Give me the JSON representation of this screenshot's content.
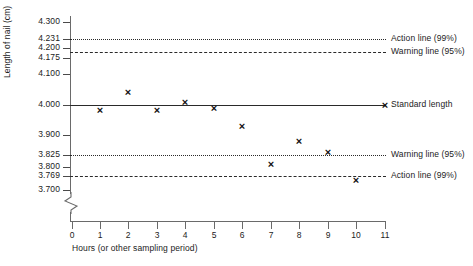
{
  "chart_data": {
    "type": "scatter",
    "title": "",
    "xlabel": "Hours (or other sampling period)",
    "ylabel": "Length of nail (cm)",
    "x": [
      1,
      2,
      3,
      4,
      5,
      6,
      7,
      8,
      9,
      10,
      11
    ],
    "values": [
      3.985,
      4.04,
      3.985,
      4.01,
      3.99,
      3.93,
      3.805,
      3.88,
      3.845,
      3.775,
      3.998
    ],
    "categories": [
      "1",
      "2",
      "3",
      "4",
      "5",
      "6",
      "7",
      "8",
      "9",
      "10",
      "11"
    ],
    "series": [
      {
        "name": "Measured nail length",
        "values": [
          3.985,
          4.04,
          3.985,
          4.01,
          3.99,
          3.93,
          3.805,
          3.88,
          3.845,
          3.775,
          3.998
        ]
      }
    ],
    "xlim": [
      0,
      11
    ],
    "ylim": [
      3.7,
      4.3
    ],
    "grid": false,
    "axis_break": true,
    "marker": "x",
    "reference_lines": [
      {
        "label": "Action line (99%)",
        "value": 4.231,
        "style": "dotted",
        "side": "upper"
      },
      {
        "label": "Warning line (95%)",
        "value": 4.195,
        "style": "dashed",
        "side": "upper"
      },
      {
        "label": "Standard length",
        "value": 4.0,
        "style": "solid",
        "side": "center"
      },
      {
        "label": "Warning line (95%)",
        "value": 3.825,
        "style": "dotted",
        "side": "lower"
      },
      {
        "label": "Action line (99%)",
        "value": 3.769,
        "style": "dashed",
        "side": "lower"
      }
    ],
    "y_ticks": [
      "4.300",
      "4.231",
      "4.200",
      "4.175",
      "4.100",
      "4.000",
      "3.900",
      "3.825",
      "3.800",
      "3.769",
      "3.700"
    ],
    "x_ticks": [
      "0",
      "1",
      "2",
      "3",
      "4",
      "5",
      "6",
      "7",
      "8",
      "9",
      "10",
      "11"
    ]
  },
  "axes": {
    "y_title": "Length of nail (cm)",
    "x_title": "Hours (or other sampling period)"
  },
  "annotations": {
    "upper_action": "Action line (99%)",
    "upper_warning": "Warning line (95%)",
    "standard": "Standard length",
    "lower_warning": "Warning line (95%)",
    "lower_action": "Action line (99%)"
  },
  "ticks": {
    "y": [
      {
        "label": "4.300",
        "y": 22
      },
      {
        "label": "4.231",
        "y": 39
      },
      {
        "label": "4.200",
        "y": 48
      },
      {
        "label": "4.175",
        "y": 58
      },
      {
        "label": "4.100",
        "y": 74
      },
      {
        "label": "4.000",
        "y": 105
      },
      {
        "label": "3.900",
        "y": 135
      },
      {
        "label": "3.825",
        "y": 155
      },
      {
        "label": "3.800",
        "y": 167
      },
      {
        "label": "3.769",
        "y": 176
      },
      {
        "label": "3.700",
        "y": 190
      }
    ],
    "x": [
      {
        "label": "0",
        "x": 72
      },
      {
        "label": "1",
        "x": 100
      },
      {
        "label": "2",
        "x": 128
      },
      {
        "label": "3",
        "x": 157
      },
      {
        "label": "4",
        "x": 185
      },
      {
        "label": "5",
        "x": 214
      },
      {
        "label": "6",
        "x": 242
      },
      {
        "label": "7",
        "x": 271
      },
      {
        "label": "8",
        "x": 299
      },
      {
        "label": "9",
        "x": 328
      },
      {
        "label": "10",
        "x": 356
      },
      {
        "label": "11",
        "x": 385
      }
    ]
  },
  "lines": [
    {
      "name": "upper-action-line",
      "y": 39,
      "style": "dotted",
      "label": "Action line (99%)"
    },
    {
      "name": "upper-warning-line",
      "y": 52,
      "style": "dashed",
      "label": "Warning line (95%)"
    },
    {
      "name": "standard-line",
      "y": 105,
      "style": "solid",
      "label": "Standard length"
    },
    {
      "name": "lower-warning-line",
      "y": 155,
      "style": "dotted",
      "label": "Warning line (95%)"
    },
    {
      "name": "lower-action-line",
      "y": 176,
      "style": "dashed",
      "label": "Action line (99%)"
    }
  ],
  "points": [
    {
      "x": 100,
      "y": 110
    },
    {
      "x": 128,
      "y": 92
    },
    {
      "x": 157,
      "y": 110
    },
    {
      "x": 185,
      "y": 102
    },
    {
      "x": 214,
      "y": 108
    },
    {
      "x": 242,
      "y": 126
    },
    {
      "x": 271,
      "y": 164
    },
    {
      "x": 299,
      "y": 141
    },
    {
      "x": 328,
      "y": 152
    },
    {
      "x": 356,
      "y": 180
    },
    {
      "x": 385,
      "y": 105
    }
  ]
}
